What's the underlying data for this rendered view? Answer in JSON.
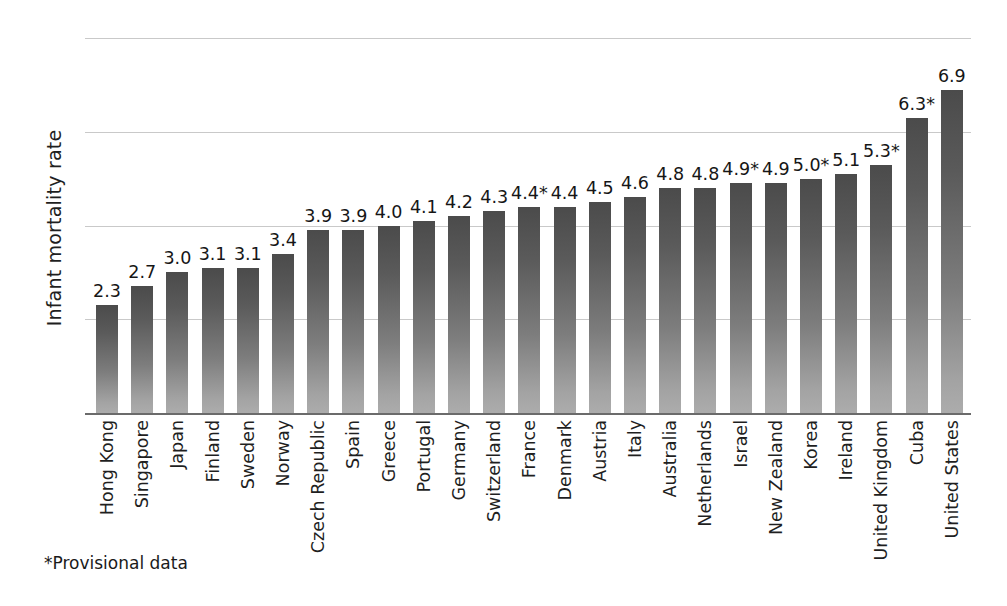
{
  "chart_data": {
    "type": "bar",
    "title": "",
    "xlabel": "",
    "ylabel": "Infant mortality rate",
    "ylim": [
      0,
      8
    ],
    "yticks": [
      0,
      2,
      4,
      6,
      8
    ],
    "grid": true,
    "legend": null,
    "orientation": "vertical",
    "categories": [
      "Hong Kong",
      "Singapore",
      "Japan",
      "Finland",
      "Sweden",
      "Norway",
      "Czech Republic",
      "Spain",
      "Greece",
      "Portugal",
      "Germany",
      "Switzerland",
      "France",
      "Denmark",
      "Austria",
      "Italy",
      "Australia",
      "Netherlands",
      "Israel",
      "New Zealand",
      "Korea",
      "Ireland",
      "United Kingdom",
      "Cuba",
      "United States"
    ],
    "values": [
      2.3,
      2.7,
      3.0,
      3.1,
      3.1,
      3.4,
      3.9,
      3.9,
      4.0,
      4.1,
      4.2,
      4.3,
      4.4,
      4.4,
      4.5,
      4.6,
      4.8,
      4.8,
      4.9,
      4.9,
      5.0,
      5.1,
      5.3,
      6.3,
      6.9
    ],
    "value_labels": [
      "2.3",
      "2.7",
      "3.0",
      "3.1",
      "3.1",
      "3.4",
      "3.9",
      "3.9",
      "4.0",
      "4.1",
      "4.2",
      "4.3",
      "4.4*",
      "4.4",
      "4.5",
      "4.6",
      "4.8",
      "4.8",
      "4.9*",
      "4.9",
      "5.0*",
      "5.1",
      "5.3*",
      "6.3*",
      "6.9"
    ],
    "provisional_flags": [
      false,
      false,
      false,
      false,
      false,
      false,
      false,
      false,
      false,
      false,
      false,
      false,
      true,
      false,
      false,
      false,
      false,
      false,
      true,
      false,
      true,
      false,
      true,
      true,
      false
    ],
    "annotations": [
      "*Provisional data"
    ],
    "colors": {
      "bar_top": "#4b4b4b",
      "bar_bottom": "#acacac",
      "gridline": "#c9c9c9",
      "axis": "#6b6b6b",
      "text": "#1f1f1f",
      "background": "#ffffff"
    }
  },
  "footnote": "*Provisional data"
}
